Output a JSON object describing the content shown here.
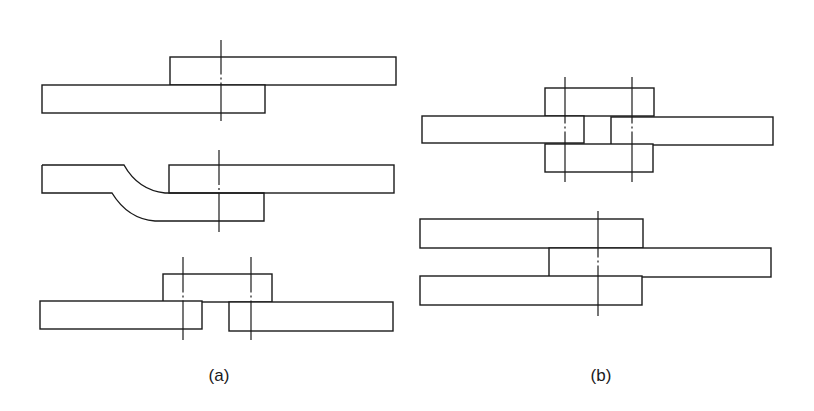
{
  "figure": {
    "panels": [
      {
        "id": "a",
        "caption": "(a)",
        "caption_pos": {
          "x": 219,
          "y": 367
        },
        "description": "Single-shear joints: lap joint, joggled lap joint, single-cover butt joint",
        "joints": [
          {
            "name": "lap-joint",
            "plates": [
              {
                "name": "upper-plate",
                "x": 170,
                "y": 57,
                "w": 226,
                "h": 28
              },
              {
                "name": "lower-plate",
                "x": 42,
                "y": 85,
                "w": 223,
                "h": 28
              }
            ],
            "centerlines": [
              {
                "x": 221,
                "y1": 40,
                "y2": 121
              }
            ]
          },
          {
            "name": "joggled-lap-joint",
            "plates": [
              {
                "name": "upper-plate",
                "x": 169,
                "y": 165,
                "w": 225,
                "h": 28
              }
            ],
            "joggled_plate_path": "M42,165 L124,165 Q138,190 165,193 L169,193 M42,165 L42,193 L112,193 Q128,219 155,221 L264,221 L264,193 L169,193",
            "centerlines": [
              {
                "x": 219,
                "y1": 150,
                "y2": 232
              }
            ]
          },
          {
            "name": "single-cover-butt-joint",
            "plates": [
              {
                "name": "cover-plate",
                "x": 163,
                "y": 274,
                "w": 109,
                "h": 28
              },
              {
                "name": "left-plate",
                "x": 40,
                "y": 301,
                "w": 162,
                "h": 28
              },
              {
                "name": "right-plate",
                "x": 229,
                "y": 302,
                "w": 164,
                "h": 29
              }
            ],
            "centerlines": [
              {
                "x": 183,
                "y1": 257,
                "y2": 340
              },
              {
                "x": 251,
                "y1": 257,
                "y2": 340
              }
            ]
          }
        ]
      },
      {
        "id": "b",
        "caption": "(b)",
        "caption_pos": {
          "x": 601,
          "y": 367
        },
        "description": "Double-shear joints: double-cover butt joint, double lap joint",
        "joints": [
          {
            "name": "double-cover-butt-joint",
            "plates": [
              {
                "name": "upper-cover-plate",
                "x": 545,
                "y": 88,
                "w": 109,
                "h": 28
              },
              {
                "name": "left-plate",
                "x": 422,
                "y": 116,
                "w": 162,
                "h": 27
              },
              {
                "name": "right-plate",
                "x": 611,
                "y": 117,
                "w": 162,
                "h": 28
              },
              {
                "name": "lower-cover-plate",
                "x": 545,
                "y": 144,
                "w": 108,
                "h": 28
              }
            ],
            "centerlines": [
              {
                "x": 565,
                "y1": 77,
                "y2": 182
              },
              {
                "x": 632,
                "y1": 77,
                "y2": 182
              }
            ]
          },
          {
            "name": "double-lap-joint",
            "plates": [
              {
                "name": "upper-plate",
                "x": 420,
                "y": 219,
                "w": 223,
                "h": 29
              },
              {
                "name": "middle-plate",
                "x": 549,
                "y": 248,
                "w": 222,
                "h": 29
              },
              {
                "name": "lower-plate",
                "x": 420,
                "y": 276,
                "w": 222,
                "h": 29
              }
            ],
            "centerlines": [
              {
                "x": 598,
                "y1": 211,
                "y2": 316
              }
            ]
          }
        ]
      }
    ],
    "colors": {
      "line": "#1a1a1a",
      "background": "#ffffff"
    }
  }
}
